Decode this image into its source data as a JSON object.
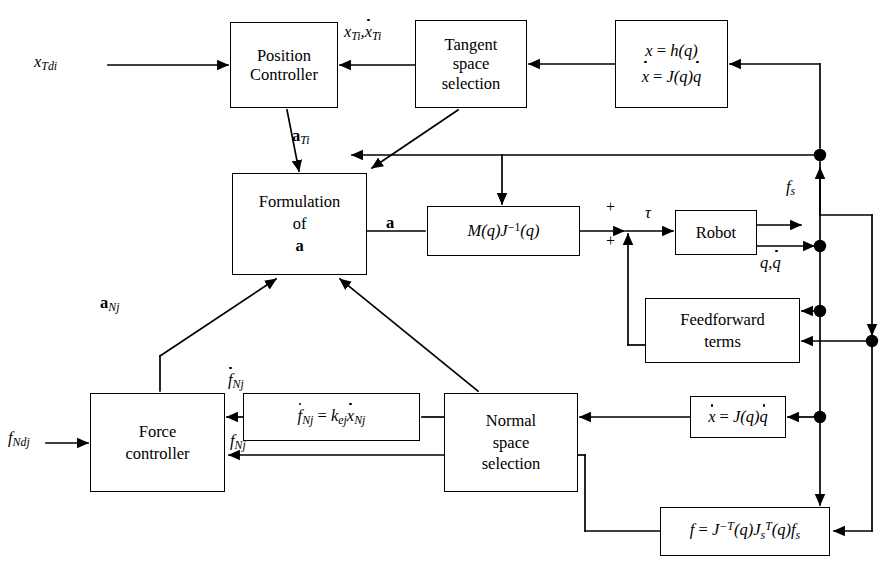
{
  "diagram": {
    "canvas": {
      "width": 891,
      "height": 572
    },
    "stroke_color": "#000000",
    "background_color": "#ffffff"
  },
  "blocks": [
    {
      "id": "position_controller",
      "label_line1": "Position",
      "label_line2": "Controller",
      "x": 230,
      "y": 22,
      "w": 108,
      "h": 86
    },
    {
      "id": "tangent_space_selection",
      "label_line1": "Tangent",
      "label_line2": "space",
      "label_line3": "selection",
      "x": 415,
      "y": 20,
      "w": 112,
      "h": 88
    },
    {
      "id": "forward_kinematics",
      "label_line1": "x = h(q)",
      "label_line2": "ẋ = J(q)q̇",
      "x": 615,
      "y": 20,
      "w": 113,
      "h": 88
    },
    {
      "id": "formulation_of_a",
      "label_line1": "Formulation",
      "label_line2": "of",
      "label_line3": "a",
      "x": 232,
      "y": 173,
      "w": 135,
      "h": 102
    },
    {
      "id": "inertia_jacobian",
      "label_line1": "M(q)J⁻¹(q)",
      "x": 427,
      "y": 206,
      "w": 153,
      "h": 50
    },
    {
      "id": "robot",
      "label_line1": "Robot",
      "x": 675,
      "y": 210,
      "w": 82,
      "h": 45
    },
    {
      "id": "feedforward_terms",
      "label_line1": "Feedforward",
      "label_line2": "terms",
      "x": 645,
      "y": 298,
      "w": 155,
      "h": 65
    },
    {
      "id": "differential_kinematics",
      "label_line1": "ẋ = J(q)q̇",
      "x": 690,
      "y": 396,
      "w": 96,
      "h": 42
    },
    {
      "id": "force_controller",
      "label_line1": "Force",
      "label_line2": "controller",
      "x": 90,
      "y": 393,
      "w": 135,
      "h": 99
    },
    {
      "id": "stiffness_relation",
      "label_line1": "ḟNj = kej ẋNj",
      "x": 243,
      "y": 393,
      "w": 177,
      "h": 48
    },
    {
      "id": "normal_space_selection",
      "label_line1": "Normal",
      "label_line2": "space",
      "label_line3": "selection",
      "x": 444,
      "y": 393,
      "w": 134,
      "h": 99
    },
    {
      "id": "force_transform",
      "label_line1": "f = J⁻T(q)JsT(q)fs",
      "x": 660,
      "y": 507,
      "w": 170,
      "h": 49
    }
  ],
  "signal_labels": [
    {
      "id": "x_Tdi",
      "text": "x",
      "sub": "Tdi",
      "x": 34,
      "y": 58
    },
    {
      "id": "x_Ti_xdot_Ti",
      "text": "x",
      "sub": "Ti",
      "text2": "x",
      "sub2": "Ti",
      "x": 346,
      "y": 24
    },
    {
      "id": "a_Ti",
      "text": "a",
      "sub": "Ti",
      "x": 276,
      "y": 133
    },
    {
      "id": "a_vector",
      "text": "a",
      "x": 386,
      "y": 215
    },
    {
      "id": "a_Nj",
      "text": "a",
      "sub": "Nj",
      "x": 100,
      "y": 297
    },
    {
      "id": "tau",
      "text": "τ",
      "x": 644,
      "y": 207
    },
    {
      "id": "f_s",
      "text": "f",
      "sub": "s",
      "x": 786,
      "y": 182
    },
    {
      "id": "q_qdot",
      "text": "q,q̇",
      "x": 762,
      "y": 257
    },
    {
      "id": "fdot_Nj",
      "text": "ḟ",
      "sub": "Nj",
      "x": 226,
      "y": 373
    },
    {
      "id": "f_Nj",
      "text": "f",
      "sub": "Nj",
      "x": 228,
      "y": 437
    },
    {
      "id": "f_Ndj",
      "text": "f",
      "sub": "Ndj",
      "x": 12,
      "y": 432
    },
    {
      "id": "plus_top",
      "text": "+",
      "x": 608,
      "y": 204
    },
    {
      "id": "plus_bottom",
      "text": "+",
      "x": 608,
      "y": 237
    }
  ],
  "junction_dots": [
    {
      "id": "junction-fs-top",
      "x": 820,
      "y": 155
    },
    {
      "id": "junction-q-mid",
      "x": 820,
      "y": 246
    },
    {
      "id": "junction-feedforward",
      "x": 820,
      "y": 311
    },
    {
      "id": "junction-right-outer",
      "x": 872,
      "y": 341
    },
    {
      "id": "junction-xdot",
      "x": 820,
      "y": 417
    }
  ],
  "block_text": {
    "position": "Position",
    "controller_cap": "Controller",
    "tangent": "Tangent",
    "space": "space",
    "selection": "selection",
    "formulation": "Formulation",
    "of": "of",
    "a_bold": "a",
    "robot": "Robot",
    "feedforward": "Feedforward",
    "terms": "terms",
    "force": "Force",
    "controller_low": "controller",
    "normal": "Normal"
  }
}
